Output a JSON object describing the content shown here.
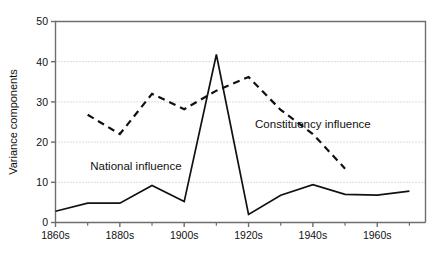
{
  "chart_data": {
    "type": "line",
    "title": "",
    "xlabel": "",
    "ylabel": "Variance components",
    "xlim": [
      1860,
      1975
    ],
    "ylim": [
      0,
      50
    ],
    "grid": "horizontal-dotted",
    "legend_position": "inline-annotations",
    "x_tick_labels": [
      "1860s",
      "1880s",
      "1900s",
      "1920s",
      "1940s",
      "1960s"
    ],
    "x_tick_values": [
      1860,
      1880,
      1900,
      1920,
      1940,
      1960
    ],
    "x_minor_tick_values": [
      1870,
      1890,
      1910,
      1930,
      1950,
      1970
    ],
    "y_tick_labels": [
      "0",
      "10",
      "20",
      "30",
      "40",
      "50"
    ],
    "y_tick_values": [
      0,
      10,
      20,
      30,
      40,
      50
    ],
    "series": [
      {
        "name": "National influence",
        "style": "solid",
        "color": "#111111",
        "x": [
          1860,
          1870,
          1880,
          1890,
          1900,
          1910,
          1920,
          1930,
          1940,
          1950,
          1960,
          1970
        ],
        "values": [
          2.8,
          4.8,
          4.8,
          9.2,
          5.2,
          41.8,
          2.0,
          6.8,
          9.4,
          7.0,
          6.8,
          7.8
        ]
      },
      {
        "name": "Constituency influence",
        "style": "dashed",
        "color": "#111111",
        "x": [
          1870,
          1880,
          1890,
          1900,
          1910,
          1920,
          1930,
          1940,
          1950
        ],
        "values": [
          26.8,
          22.0,
          32.0,
          28.2,
          32.8,
          36.2,
          28.0,
          22.0,
          13.4
        ]
      }
    ],
    "annotations": [
      {
        "text": "National influence",
        "x": 1885,
        "y": 13.0,
        "name": "national-influence-label"
      },
      {
        "text": "Constituency influence",
        "x": 1940,
        "y": 23.5,
        "name": "constituency-influence-label"
      }
    ]
  },
  "axes": {
    "y_axis_title": "Variance components"
  },
  "colors": {
    "line": "#111111",
    "grid": "#b8b8b8",
    "axis": "#6e6e6e",
    "background": "#ffffff"
  }
}
